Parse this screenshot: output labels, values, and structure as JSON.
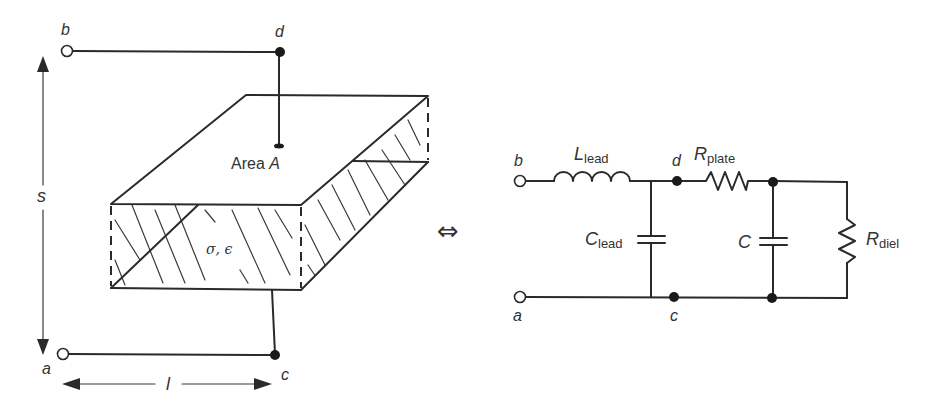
{
  "figure": {
    "left_panel": {
      "title": "Parallel-plate capacitor with lossy dielectric",
      "terminals": {
        "a": "a",
        "b": "b",
        "c": "c",
        "d": "d"
      },
      "dimension_s": "s",
      "dimension_l": "l",
      "area_label": "Area ",
      "area_symbol": "A",
      "dielectric_label": "σ, ϵ"
    },
    "equivalence_symbol": "⇔",
    "right_panel": {
      "title": "Equivalent circuit",
      "terminals": {
        "a": "a",
        "b": "b",
        "c": "c",
        "d": "d"
      },
      "components": [
        {
          "id": "L_lead",
          "symbol": "L",
          "subscript": "lead",
          "type": "inductor"
        },
        {
          "id": "C_lead",
          "symbol": "C",
          "subscript": "lead",
          "type": "capacitor"
        },
        {
          "id": "R_plate",
          "symbol": "R",
          "subscript": "plate",
          "type": "resistor"
        },
        {
          "id": "C",
          "symbol": "C",
          "subscript": "",
          "type": "capacitor"
        },
        {
          "id": "R_diel",
          "symbol": "R",
          "subscript": "diel",
          "type": "resistor"
        }
      ]
    },
    "colors": {
      "line": "#2a2a2a",
      "text": "#333333",
      "background": "#ffffff"
    }
  }
}
